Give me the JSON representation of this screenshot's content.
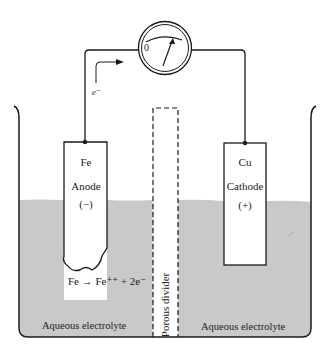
{
  "meter": {
    "zero_label": "0",
    "icon": "galvanometer-icon"
  },
  "electron_flow": {
    "label": "e⁻",
    "direction": "toward meter"
  },
  "anode": {
    "element": "Fe",
    "name": "Anode",
    "sign": "(−)"
  },
  "cathode": {
    "element": "Cu",
    "name": "Cathode",
    "sign": "(+)"
  },
  "reaction": {
    "text": "Fe → Fe⁺⁺ + 2e⁻"
  },
  "divider": {
    "label": "Porous divider"
  },
  "electrolyte_left": {
    "label": "Aqueous electrolyte"
  },
  "electrolyte_right": {
    "label": "Aqueous electrolyte"
  },
  "colors": {
    "electrolyte": "#c9c9c9",
    "line": "#1a1a1a",
    "background": "#ffffff"
  }
}
